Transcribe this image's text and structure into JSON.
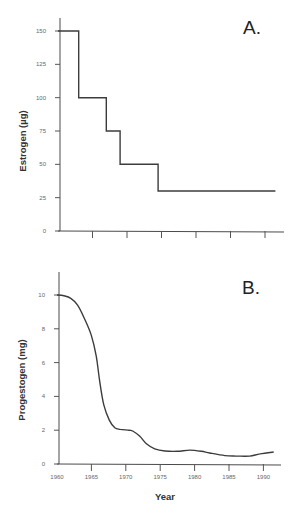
{
  "chart_data": [
    {
      "id": "A",
      "type": "line",
      "step": true,
      "panel_label": "A.",
      "title": "",
      "xlabel": "",
      "ylabel": "Estrogen  (µg)",
      "xlim": [
        1960,
        1993
      ],
      "ylim": [
        0,
        160
      ],
      "yticks": [
        0,
        25,
        50,
        75,
        100,
        125,
        150
      ],
      "ytick_labels": [
        "0",
        "25",
        "50",
        "75",
        "100",
        "125",
        "150"
      ],
      "xticks": [
        1965,
        1970,
        1975,
        1980,
        1985,
        1990
      ],
      "xtick_labels": [
        "",
        "",
        "",
        "",
        "",
        ""
      ],
      "grid": false,
      "legend": null,
      "series": [
        {
          "name": "Estrogen dose",
          "x": [
            1960,
            1963,
            1963,
            1967,
            1967,
            1969,
            1969,
            1974.5,
            1974.5,
            1991.5
          ],
          "y": [
            150,
            150,
            100,
            100,
            75,
            75,
            50,
            50,
            30,
            30
          ]
        }
      ]
    },
    {
      "id": "B",
      "type": "line",
      "step": false,
      "panel_label": "B.",
      "title": "",
      "xlabel": "Year",
      "ylabel": "Progestogen  (mg)",
      "xlim": [
        1960,
        1993
      ],
      "ylim": [
        0,
        11.2
      ],
      "yticks": [
        0,
        2,
        4,
        6,
        8,
        10
      ],
      "ytick_labels": [
        "0",
        "2",
        "4",
        "6",
        "8",
        "10"
      ],
      "xticks": [
        1960,
        1965,
        1970,
        1975,
        1980,
        1985,
        1990
      ],
      "xtick_labels": [
        "1960",
        "1965",
        "1970",
        "1975",
        "1980",
        "1985",
        "1990"
      ],
      "grid": false,
      "legend": null,
      "series": [
        {
          "name": "Progestogen dose",
          "x": [
            1960,
            1961,
            1962,
            1963,
            1964,
            1965,
            1965.7,
            1966.2,
            1966.8,
            1967.6,
            1968.4,
            1969.2,
            1970.5,
            1971,
            1972,
            1973,
            1974.2,
            1975.7,
            1977.5,
            1979.3,
            1981,
            1982.2,
            1984.4,
            1986,
            1988,
            1989.5,
            1991.5
          ],
          "y": [
            10,
            9.95,
            9.8,
            9.4,
            8.6,
            7.6,
            6.4,
            4.9,
            3.5,
            2.6,
            2.15,
            2.05,
            2.0,
            1.95,
            1.65,
            1.2,
            0.9,
            0.77,
            0.75,
            0.82,
            0.75,
            0.65,
            0.5,
            0.47,
            0.47,
            0.6,
            0.71
          ]
        }
      ]
    }
  ]
}
